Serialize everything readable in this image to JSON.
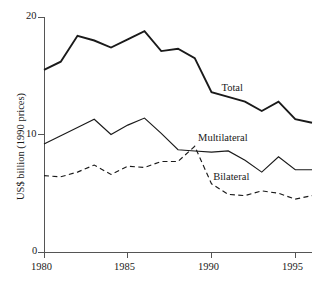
{
  "chart_data": {
    "type": "line",
    "title": "",
    "subtitle": "",
    "xlabel": "",
    "ylabel": "US$ billion (1990 prices)",
    "x": [
      1980,
      1981,
      1982,
      1983,
      1984,
      1985,
      1986,
      1987,
      1988,
      1989,
      1990,
      1991,
      1992,
      1993,
      1994,
      1995,
      1996
    ],
    "xlim": [
      1980,
      1996
    ],
    "ylim": [
      0,
      20
    ],
    "grid": false,
    "legend_position": "inline-annotations",
    "x_tick_labels": [
      "1980",
      "1985",
      "1990",
      "1995"
    ],
    "x_tick_values": [
      1980,
      1985,
      1990,
      1995
    ],
    "y_tick_labels": [
      "0",
      "10",
      "20"
    ],
    "y_tick_values": [
      0,
      10,
      20
    ],
    "series": [
      {
        "name": "Total",
        "style": "solid-thick",
        "color": "#1a1a1a",
        "label_x": 1990.6,
        "label_y": 13.9,
        "values": [
          15.5,
          16.2,
          18.4,
          18.0,
          17.4,
          18.1,
          18.8,
          17.1,
          17.3,
          16.5,
          13.6,
          13.2,
          12.8,
          12.0,
          12.8,
          11.3,
          11.0
        ]
      },
      {
        "name": "Multilateral",
        "style": "solid-thin",
        "color": "#1a1a1a",
        "label_x": 1989.2,
        "label_y": 9.6,
        "values": [
          9.2,
          9.9,
          10.6,
          11.3,
          10.0,
          10.8,
          11.4,
          10.1,
          8.7,
          8.6,
          8.5,
          8.6,
          7.8,
          6.8,
          8.1,
          7.0,
          7.0
        ]
      },
      {
        "name": "Bilateral",
        "style": "dashed",
        "color": "#1a1a1a",
        "label_x": 1990.1,
        "label_y": 6.3,
        "values": [
          6.5,
          6.4,
          6.8,
          7.4,
          6.6,
          7.3,
          7.2,
          7.7,
          7.7,
          9.0,
          5.8,
          4.9,
          4.8,
          5.2,
          5.0,
          4.5,
          4.8
        ]
      }
    ]
  },
  "axes": {
    "y_label": "US$ billion (1990 prices)",
    "y_ticks": [
      "20",
      "10",
      "0"
    ],
    "x_ticks": [
      "1980",
      "1985",
      "1990",
      "1995"
    ]
  },
  "annotations": {
    "total_label": "Total",
    "multilateral_label": "Multilateral",
    "bilateral_label": "Bilateral"
  }
}
